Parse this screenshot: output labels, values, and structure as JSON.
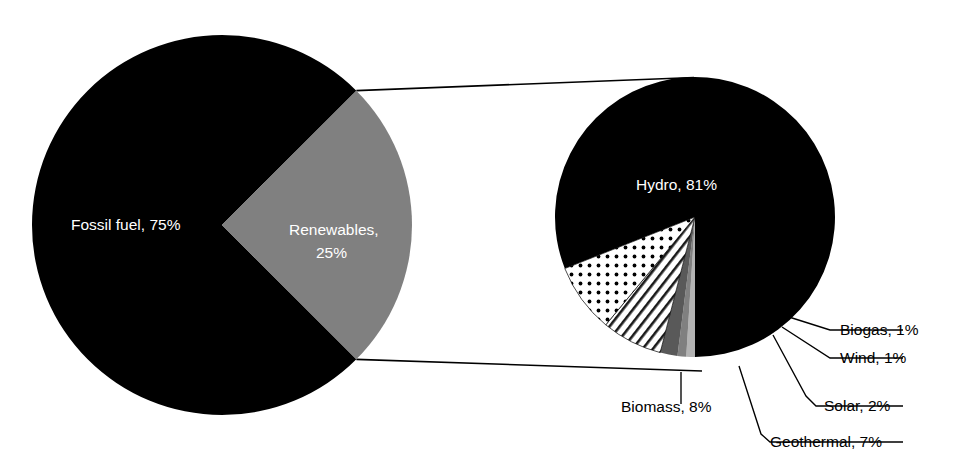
{
  "chart_data": {
    "type": "pie",
    "title": "",
    "subtitle": "",
    "xlabel": "",
    "ylabel": "",
    "legend_position": "none",
    "grid": false,
    "charts": [
      {
        "name": "primary-pie",
        "type": "pie",
        "categories": [
          "Fossil fuel",
          "Renewables"
        ],
        "values": [
          75,
          25
        ],
        "unit": "%",
        "labels": [
          "Fossil fuel, 75%",
          "Renewables, 25%"
        ],
        "colors": [
          "#000000",
          "#808080"
        ],
        "label_colors": [
          "#ffffff",
          "#ffffff"
        ]
      },
      {
        "name": "secondary-pie",
        "type": "pie",
        "categories": [
          "Hydro",
          "Biomass",
          "Geothermal",
          "Solar",
          "Wind",
          "Biogas"
        ],
        "values": [
          81,
          8,
          7,
          2,
          1,
          1
        ],
        "unit": "%",
        "labels": [
          "Hydro, 81%",
          "Biomass, 8%",
          "Geothermal, 7%",
          "Solar, 2%",
          "Wind, 1%",
          "Biogas, 1%"
        ],
        "colors": [
          "#000000",
          "#ffffff",
          "#ffffff",
          "#595959",
          "#808080",
          "#b3b3b3"
        ],
        "patterns": [
          "solid",
          "dots",
          "diagonal-lines",
          "solid",
          "solid",
          "solid"
        ],
        "label_colors": [
          "#ffffff",
          "#000000",
          "#000000",
          "#000000",
          "#000000",
          "#000000"
        ]
      }
    ]
  },
  "primary": {
    "fossil": {
      "label": "Fossil fuel, 75%",
      "name": "Fossil fuel",
      "value": 75
    },
    "renewables_line1": "Renewables,",
    "renewables_line2": "25%",
    "renewables": {
      "label": "Renewables, 25%",
      "name": "Renewables",
      "value": 25
    }
  },
  "secondary": {
    "hydro": {
      "label": "Hydro, 81%",
      "name": "Hydro",
      "value": 81
    },
    "biomass": {
      "label": "Biomass, 8%",
      "name": "Biomass",
      "value": 8
    },
    "geothermal": {
      "label": "Geothermal, 7%",
      "name": "Geothermal",
      "value": 7
    },
    "solar": {
      "label": "Solar, 2%",
      "name": "Solar",
      "value": 2
    },
    "wind": {
      "label": "Wind, 1%",
      "name": "Wind",
      "value": 1
    },
    "biogas": {
      "label": "Biogas, 1%",
      "name": "Biogas",
      "value": 1
    }
  },
  "colors": {
    "black": "#000000",
    "mid_gray": "#808080",
    "dark_gray": "#595959",
    "light_gray": "#b3b3b3",
    "white": "#ffffff",
    "background": "#ffffff"
  }
}
